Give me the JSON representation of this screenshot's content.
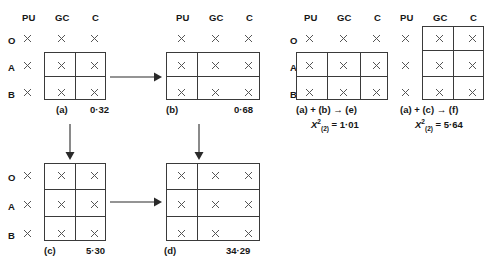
{
  "diagram": {
    "column_headers": [
      "PU",
      "GC",
      "C"
    ],
    "row_labels": [
      "O",
      "A",
      "B"
    ],
    "cell_marker": "x",
    "line_color": "#3a3a3a",
    "text_color": "#161616",
    "panels": [
      {
        "id": "a",
        "caption": "(a)",
        "value": "0·32",
        "box_columns": [
          "GC",
          "C"
        ],
        "box_rows": [
          "A",
          "B"
        ],
        "show_row_labels": true,
        "show_col_headers": true
      },
      {
        "id": "b",
        "caption": "(b)",
        "value": "0·68",
        "box_columns": [
          "PU",
          "GC",
          "C"
        ],
        "box_rows": [
          "A",
          "B"
        ],
        "show_row_labels": false,
        "show_col_headers": true
      },
      {
        "id": "e",
        "caption": "(a) + (b) → (e)",
        "value": "1·01",
        "chisq_label": "X",
        "chisq_sup": "2",
        "chisq_sub": "(2)",
        "chisq_eq": "= 1·01",
        "box_columns": [
          "PU",
          "GC",
          "C"
        ],
        "box_rows": [
          "A",
          "B"
        ],
        "show_row_labels": true,
        "show_col_headers": true
      },
      {
        "id": "f",
        "caption": "(a) + (c) → (f)",
        "value": "5·64",
        "chisq_label": "X",
        "chisq_sup": "2",
        "chisq_sub": "(2)",
        "chisq_eq": "= 5·64",
        "box_columns": [
          "GC",
          "C"
        ],
        "box_rows": [
          "O",
          "A",
          "B"
        ],
        "show_row_labels": false,
        "show_col_headers": true
      },
      {
        "id": "c",
        "caption": "(c)",
        "value": "5·30",
        "box_columns": [
          "GC",
          "C"
        ],
        "box_rows": [
          "O",
          "A",
          "B"
        ],
        "show_row_labels": true,
        "show_col_headers": false
      },
      {
        "id": "d",
        "caption": "(d)",
        "value": "34·29",
        "box_columns": [
          "PU",
          "GC",
          "C"
        ],
        "box_rows": [
          "O",
          "A",
          "B"
        ],
        "show_row_labels": false,
        "show_col_headers": false
      }
    ],
    "arrows": [
      {
        "name": "arrow-a-to-b",
        "direction": "right"
      },
      {
        "name": "arrow-a-to-c",
        "direction": "down"
      },
      {
        "name": "arrow-b-to-d",
        "direction": "down"
      },
      {
        "name": "arrow-c-to-d",
        "direction": "right"
      }
    ]
  }
}
